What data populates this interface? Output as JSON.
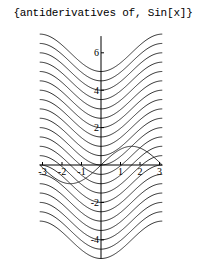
{
  "chart_data": {
    "type": "line",
    "title": "{antiderivatives of, Sin[x]}",
    "xlabel": "",
    "ylabel": "",
    "xlim": [
      -3.14159,
      3.14159
    ],
    "ylim": [
      -5,
      7
    ],
    "grid": false,
    "legend": null,
    "x_ticks": [
      -3,
      -2,
      -1,
      1,
      2,
      3
    ],
    "y_ticks": [
      -4,
      -2,
      2,
      4,
      6
    ],
    "series": [
      {
        "name": "antiderivatives: -Cos[x] + C",
        "formula": "-cos(x) + C",
        "constants": [
          -4,
          -3.5,
          -3,
          -2.5,
          -2,
          -1.5,
          -1,
          -0.5,
          0,
          0.5,
          1,
          1.5,
          2,
          2.5,
          3,
          3.5,
          4,
          4.5,
          5,
          5.5,
          6
        ],
        "color": "#333333"
      },
      {
        "name": "Sin[x]",
        "formula": "sin(x)",
        "color": "#333333"
      }
    ]
  },
  "axes": {
    "origin_px": [
      101,
      165
    ],
    "x_px_per_unit": 19.5,
    "y_px_per_unit": 18.7
  }
}
